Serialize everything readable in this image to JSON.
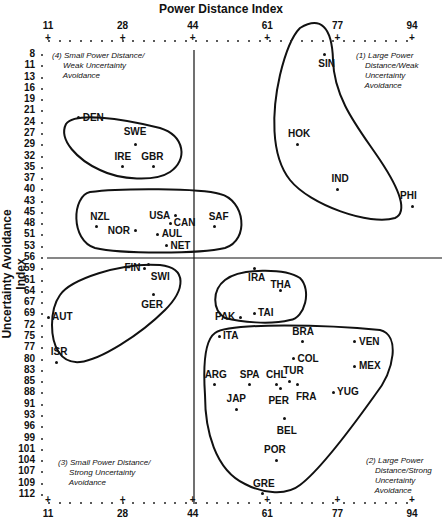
{
  "chart_data": {
    "type": "scatter",
    "title": "Power Distance Index",
    "xlabel": "Power Distance Index",
    "ylabel": "Uncertainty Avoidance Index",
    "x_ticks": [
      11,
      28,
      44,
      61,
      77,
      94
    ],
    "y_ticks": [
      8,
      11,
      13,
      16,
      19,
      21,
      24,
      27,
      29,
      32,
      35,
      37,
      40,
      43,
      45,
      48,
      51,
      53,
      56,
      59,
      61,
      64,
      67,
      69,
      72,
      75,
      77,
      80,
      83,
      85,
      88,
      91,
      93,
      96,
      99,
      101,
      104,
      107,
      109,
      112
    ],
    "xlim": [
      11,
      94
    ],
    "ylim": [
      8,
      112
    ],
    "divider_x": 44,
    "divider_y": 56,
    "quadrants": [
      {
        "id": 1,
        "label": "(1) Large Power\n    Distance/Weak\n    Uncertainty\n    Avoidance"
      },
      {
        "id": 2,
        "label": "(2) Large Power\n    Distance/Strong\n    Uncertainty\n    Avoidance"
      },
      {
        "id": 3,
        "label": "(3) Small Power Distance/\n     Strong Uncertainty\n     Avoidance"
      },
      {
        "id": 4,
        "label": "(4) Small Power Distance/\n     Weak Uncertainty\n     Avoidance"
      }
    ],
    "points": [
      {
        "name": "DEN",
        "x": 18,
        "y": 23
      },
      {
        "name": "SWE",
        "x": 31,
        "y": 29
      },
      {
        "name": "IRE",
        "x": 28,
        "y": 35
      },
      {
        "name": "GBR",
        "x": 35,
        "y": 35
      },
      {
        "name": "NZL",
        "x": 22,
        "y": 49
      },
      {
        "name": "USA",
        "x": 40,
        "y": 46
      },
      {
        "name": "CAN",
        "x": 39,
        "y": 48
      },
      {
        "name": "NOR",
        "x": 31,
        "y": 50
      },
      {
        "name": "AUL",
        "x": 36,
        "y": 51
      },
      {
        "name": "NET",
        "x": 38,
        "y": 53
      },
      {
        "name": "SAF",
        "x": 49,
        "y": 49
      },
      {
        "name": "SIN",
        "x": 74,
        "y": 8
      },
      {
        "name": "HOK",
        "x": 68,
        "y": 29
      },
      {
        "name": "IND",
        "x": 77,
        "y": 40
      },
      {
        "name": "PHI",
        "x": 94,
        "y": 44
      },
      {
        "name": "FIN",
        "x": 33,
        "y": 59
      },
      {
        "name": "SWI",
        "x": 34,
        "y": 58
      },
      {
        "name": "GER",
        "x": 35,
        "y": 65
      },
      {
        "name": "AUT",
        "x": 11,
        "y": 70
      },
      {
        "name": "ISR",
        "x": 13,
        "y": 81
      },
      {
        "name": "IRA",
        "x": 58,
        "y": 59
      },
      {
        "name": "THA",
        "x": 64,
        "y": 64
      },
      {
        "name": "PAK",
        "x": 55,
        "y": 70
      },
      {
        "name": "TAI",
        "x": 58,
        "y": 69
      },
      {
        "name": "ITA",
        "x": 50,
        "y": 75
      },
      {
        "name": "BRA",
        "x": 69,
        "y": 76
      },
      {
        "name": "VEN",
        "x": 81,
        "y": 76
      },
      {
        "name": "COL",
        "x": 67,
        "y": 80
      },
      {
        "name": "ARG",
        "x": 49,
        "y": 86
      },
      {
        "name": "SPA",
        "x": 57,
        "y": 86
      },
      {
        "name": "CHL",
        "x": 63,
        "y": 86
      },
      {
        "name": "TUR",
        "x": 66,
        "y": 85
      },
      {
        "name": "MEX",
        "x": 81,
        "y": 82
      },
      {
        "name": "FRA",
        "x": 68,
        "y": 86
      },
      {
        "name": "YUG",
        "x": 76,
        "y": 88
      },
      {
        "name": "PER",
        "x": 64,
        "y": 87
      },
      {
        "name": "JAP",
        "x": 54,
        "y": 92
      },
      {
        "name": "BEL",
        "x": 65,
        "y": 94
      },
      {
        "name": "POR",
        "x": 63,
        "y": 104
      },
      {
        "name": "GRE",
        "x": 60,
        "y": 112
      }
    ]
  },
  "labels": {
    "title": "Power Distance Index",
    "ylabel": "Uncertainty Avoidance Index",
    "q1": "(1) Large Power\n    Distance/Weak\n    Uncertainty\n    Avoidance",
    "q2": "(2) Large Power\n    Distance/Strong\n    Uncertainty\n    Avoidance",
    "q3": "(3) Small Power Distance/\n     Strong Uncertainty\n     Avoidance",
    "q4": "(4) Small Power Distance/\n     Weak Uncertainty\n     Avoidance"
  }
}
